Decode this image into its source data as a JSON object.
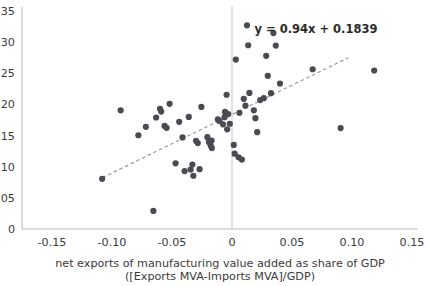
{
  "chart_data": {
    "type": "scatter",
    "title": "",
    "xlabel": "net exports of manufacturing value added as share of GDP",
    "xlabel_line2": "([Exports MVA-Imports MVA]/GDP)",
    "ylabel": "",
    "xlim": [
      -0.175,
      0.155
    ],
    "ylim": [
      0,
      0.357
    ],
    "xticks": [
      -0.15,
      -0.1,
      -0.05,
      0,
      0.05,
      0.1,
      0.15
    ],
    "xticklabels": [
      "-0.15",
      "-0.10",
      "-0.05",
      "0",
      "0.05",
      "0.10",
      "0.15"
    ],
    "yticks": [
      0,
      0.05,
      0.1,
      0.15,
      0.2,
      0.25,
      0.3,
      0.35
    ],
    "yticklabels": [
      "0",
      "0.05",
      "0.10",
      "0.15",
      "0.20",
      "0.25",
      "0.30",
      "0.35"
    ],
    "grid": false,
    "legend": null,
    "annotations": [
      {
        "name": "regression-equation",
        "text": "y = 0.94x + 0.1839",
        "x": 0.07,
        "y": 0.315
      }
    ],
    "trendline": {
      "type": "linear",
      "slope": 0.94,
      "intercept": 0.1839,
      "style": "dashed",
      "color": "#9a9a9a",
      "x_start": -0.108,
      "x_end": 0.097
    },
    "zero_line": {
      "x": 0,
      "color": "#c4c4c4"
    },
    "marker": {
      "color": "#4a4a52",
      "size": 3.1,
      "shape": "circle"
    },
    "points": [
      {
        "x": -0.1082,
        "y": 0.0805
      },
      {
        "x": -0.0928,
        "y": 0.1905
      },
      {
        "x": -0.0655,
        "y": 0.029
      },
      {
        "x": -0.078,
        "y": 0.1505
      },
      {
        "x": -0.0718,
        "y": 0.164
      },
      {
        "x": -0.0632,
        "y": 0.179
      },
      {
        "x": -0.06,
        "y": 0.193
      },
      {
        "x": -0.059,
        "y": 0.1885
      },
      {
        "x": -0.0562,
        "y": 0.1655
      },
      {
        "x": -0.0545,
        "y": 0.1625
      },
      {
        "x": -0.052,
        "y": 0.201
      },
      {
        "x": -0.047,
        "y": 0.1055
      },
      {
        "x": -0.044,
        "y": 0.172
      },
      {
        "x": -0.0412,
        "y": 0.147
      },
      {
        "x": -0.0395,
        "y": 0.093
      },
      {
        "x": -0.036,
        "y": 0.18
      },
      {
        "x": -0.0345,
        "y": 0.0955
      },
      {
        "x": -0.033,
        "y": 0.1035
      },
      {
        "x": -0.0322,
        "y": 0.0855
      },
      {
        "x": -0.03,
        "y": 0.1415
      },
      {
        "x": -0.0285,
        "y": 0.138
      },
      {
        "x": -0.027,
        "y": 0.096
      },
      {
        "x": -0.0255,
        "y": 0.196
      },
      {
        "x": -0.0205,
        "y": 0.1475
      },
      {
        "x": -0.0192,
        "y": 0.1395
      },
      {
        "x": -0.0178,
        "y": 0.134
      },
      {
        "x": -0.017,
        "y": 0.142
      },
      {
        "x": -0.0168,
        "y": 0.13
      },
      {
        "x": -0.0118,
        "y": 0.176
      },
      {
        "x": -0.0105,
        "y": 0.1735
      },
      {
        "x": -0.0075,
        "y": 0.168
      },
      {
        "x": -0.0062,
        "y": 0.1795
      },
      {
        "x": -0.0058,
        "y": 0.188
      },
      {
        "x": -0.0045,
        "y": 0.2155
      },
      {
        "x": -0.004,
        "y": 0.16
      },
      {
        "x": -0.0032,
        "y": 0.1845
      },
      {
        "x": -0.0018,
        "y": 0.169
      },
      {
        "x": 0.0015,
        "y": 0.135
      },
      {
        "x": 0.0022,
        "y": 0.121
      },
      {
        "x": 0.0032,
        "y": 0.272
      },
      {
        "x": 0.0055,
        "y": 0.115
      },
      {
        "x": 0.0062,
        "y": 0.1865
      },
      {
        "x": 0.0082,
        "y": 0.1115
      },
      {
        "x": 0.0098,
        "y": 0.209
      },
      {
        "x": 0.0112,
        "y": 0.198
      },
      {
        "x": 0.0125,
        "y": 0.327
      },
      {
        "x": 0.0135,
        "y": 0.295
      },
      {
        "x": 0.0145,
        "y": 0.2185
      },
      {
        "x": 0.0182,
        "y": 0.1905
      },
      {
        "x": 0.0195,
        "y": 0.178
      },
      {
        "x": 0.021,
        "y": 0.1555
      },
      {
        "x": 0.0235,
        "y": 0.207
      },
      {
        "x": 0.0265,
        "y": 0.21
      },
      {
        "x": 0.0285,
        "y": 0.278
      },
      {
        "x": 0.0298,
        "y": 0.246
      },
      {
        "x": 0.0325,
        "y": 0.218
      },
      {
        "x": 0.0345,
        "y": 0.3145
      },
      {
        "x": 0.0365,
        "y": 0.2945
      },
      {
        "x": 0.04,
        "y": 0.2335
      },
      {
        "x": 0.0672,
        "y": 0.2565
      },
      {
        "x": 0.0905,
        "y": 0.162
      },
      {
        "x": 0.1185,
        "y": 0.2545
      }
    ]
  }
}
